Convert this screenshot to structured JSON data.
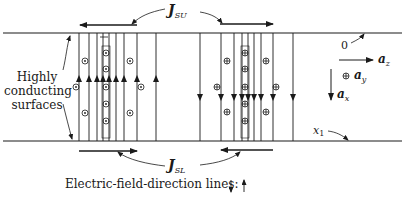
{
  "figure": {
    "labels": {
      "j_su": {
        "main": "J",
        "sub": "SU"
      },
      "j_sl": {
        "main": "J",
        "sub": "SL"
      },
      "highly_conducting": [
        "Highly",
        "conducting",
        "surfaces"
      ],
      "origin": "0",
      "x1": {
        "main": "x",
        "sub": "1"
      },
      "az": {
        "main": "a",
        "sub": "z"
      },
      "ay": {
        "main": "a",
        "sub": "y"
      },
      "ax": {
        "main": "a",
        "sub": "x"
      },
      "legend": "Electric-field-direction lines:"
    },
    "plates": {
      "top_y": 33,
      "bottom_y": 141,
      "x_start": 0,
      "x_end": 402
    },
    "upward_field_lines_x": [
      79,
      89,
      97,
      103,
      109,
      116,
      124,
      137,
      156
    ],
    "downward_field_lines_x": [
      200,
      221,
      234,
      242,
      248,
      254,
      261,
      273,
      293
    ],
    "dot_symbols": "out-of-page (⊙)",
    "cross_symbols": "into-page (⊕)",
    "colors": {
      "ink": "#1a1a1a",
      "background": "#ffffff"
    }
  }
}
